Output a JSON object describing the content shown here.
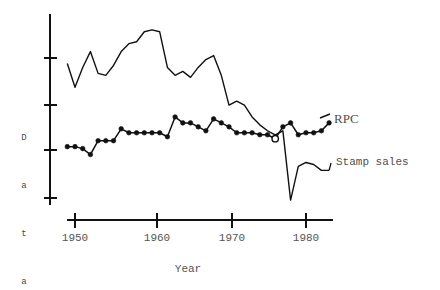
{
  "axes": {
    "y_title": "Data",
    "y_title_chars": [
      "D",
      "a",
      "t",
      "a"
    ],
    "x_title": "Year",
    "x_ticks": [
      "1950",
      "1960",
      "1970",
      "1980"
    ]
  },
  "labels": {
    "rpc": "RPC",
    "stamp_sales": "Stamp sales"
  },
  "colors": {
    "line": "#111111",
    "text": "#4f4f4f",
    "background": "#ffffff"
  },
  "chart_data": {
    "type": "line",
    "title": "",
    "xlabel": "Year",
    "ylabel": "Data",
    "xlim": [
      1948.5,
      1984
    ],
    "ylim": [
      0,
      100
    ],
    "grid": false,
    "legend": "inline-right",
    "x_tick_values": [
      1950,
      1960,
      1970,
      1980
    ],
    "y_tick_values": [
      22,
      45,
      68,
      91
    ],
    "y_tick_labels": [
      "",
      "",
      "",
      ""
    ],
    "series": [
      {
        "name": "Stamp sales",
        "style": "plain-line",
        "marker": "none",
        "x": [
          1949,
          1950,
          1951,
          1952,
          1953,
          1954,
          1955,
          1956,
          1957,
          1958,
          1959,
          1960,
          1961,
          1962,
          1963,
          1964,
          1965,
          1966,
          1967,
          1968,
          1969,
          1970,
          1971,
          1972,
          1973,
          1974,
          1975,
          1976,
          1977,
          1978,
          1979,
          1980,
          1981,
          1982,
          1983
        ],
        "y": [
          74,
          62,
          72,
          80,
          69,
          68,
          73,
          80,
          84,
          85,
          90,
          91,
          90,
          72,
          68,
          70,
          67,
          72,
          76,
          78,
          68,
          53,
          55,
          53,
          47,
          43,
          40,
          38,
          40,
          5,
          22,
          24,
          23,
          20,
          20
        ]
      },
      {
        "name": "RPC",
        "style": "line-with-markers",
        "marker": "filled-circle",
        "open_marker_years": [
          1976
        ],
        "x": [
          1949,
          1950,
          1951,
          1952,
          1953,
          1954,
          1955,
          1956,
          1957,
          1958,
          1959,
          1960,
          1961,
          1962,
          1963,
          1964,
          1965,
          1966,
          1967,
          1968,
          1969,
          1970,
          1971,
          1972,
          1973,
          1974,
          1975,
          1976,
          1977,
          1978,
          1979,
          1980,
          1981,
          1982,
          1983
        ],
        "y": [
          32,
          32,
          31,
          28,
          35,
          35,
          35,
          41,
          39,
          39,
          39,
          39,
          39,
          37,
          47,
          44,
          44,
          42,
          40,
          46,
          44,
          42,
          39,
          39,
          39,
          38,
          38,
          36,
          42,
          44,
          38,
          39,
          39,
          40,
          44
        ]
      }
    ]
  }
}
